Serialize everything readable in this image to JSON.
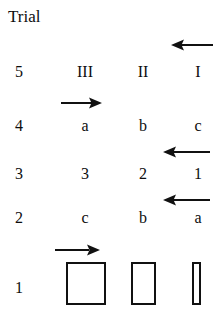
{
  "figure": {
    "title": "Trial",
    "background_color": "#ffffff",
    "ink_color": "#111111",
    "width": 220,
    "height": 321
  },
  "columns": {
    "headers": [
      "III",
      "II",
      "I"
    ]
  },
  "rows": [
    {
      "trial": "5",
      "values": [
        "III",
        "II",
        "I"
      ],
      "kind": "roman"
    },
    {
      "trial": "4",
      "values": [
        "a",
        "b",
        "c"
      ],
      "kind": "letters"
    },
    {
      "trial": "3",
      "values": [
        "3",
        "2",
        "1"
      ],
      "kind": "digits"
    },
    {
      "trial": "2",
      "values": [
        "c",
        "b",
        "a"
      ],
      "kind": "letters"
    },
    {
      "trial": "1",
      "values": [
        "",
        "",
        ""
      ],
      "kind": "bars"
    }
  ],
  "arrows": [
    {
      "id": "arrow-row5-right",
      "direction": "left",
      "row": "5"
    },
    {
      "id": "arrow-row4-left",
      "direction": "right",
      "row": "4"
    },
    {
      "id": "arrow-row3-right",
      "direction": "left",
      "row": "3"
    },
    {
      "id": "arrow-row2-right",
      "direction": "left",
      "row": "2"
    },
    {
      "id": "arrow-row1-left",
      "direction": "right",
      "row": "1"
    }
  ],
  "bars": [
    {
      "label": "bar-wide",
      "width": 40,
      "height": 43
    },
    {
      "label": "bar-medium",
      "width": 25,
      "height": 43
    },
    {
      "label": "bar-narrow",
      "width": 9,
      "height": 43
    }
  ]
}
